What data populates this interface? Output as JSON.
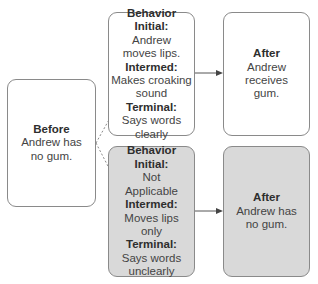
{
  "diagram": {
    "before": {
      "heading": "Before",
      "lines": [
        "Andrew has",
        "no gum."
      ]
    },
    "branch_top": {
      "behavior": {
        "heading": "Behavior",
        "initial_label": "Initial:",
        "initial_lines": [
          "Andrew",
          "moves lips."
        ],
        "intermed_label": "Intermed:",
        "intermed_lines": [
          "Makes croaking",
          "sound"
        ],
        "terminal_label": "Terminal:",
        "terminal_lines": [
          "Says words",
          "clearly"
        ]
      },
      "after": {
        "heading": "After",
        "lines": [
          "Andrew",
          "receives",
          "gum."
        ]
      }
    },
    "branch_bottom": {
      "behavior": {
        "heading": "Behavior",
        "initial_label": "Initial:",
        "initial_lines": [
          "Not",
          "Applicable"
        ],
        "intermed_label": "Intermed:",
        "intermed_lines": [
          "Moves lips",
          "only"
        ],
        "terminal_label": "Terminal:",
        "terminal_lines": [
          "Says words",
          "unclearly"
        ]
      },
      "after": {
        "heading": "After",
        "lines": [
          "Andrew has",
          "no gum."
        ]
      }
    },
    "colors": {
      "border": "#8a8a8a",
      "shaded_fill": "#d9d9d9",
      "white_fill": "#ffffff",
      "text": "#3a3a3a"
    }
  }
}
